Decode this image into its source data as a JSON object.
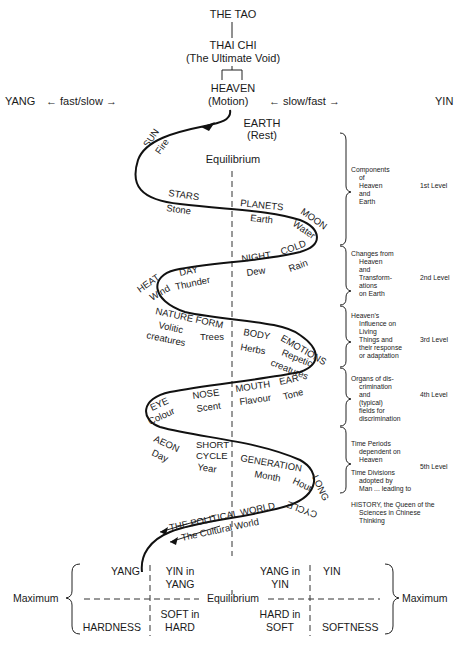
{
  "hierarchy": {
    "tao": "THE TAO",
    "thai_chi": "THAI CHI",
    "thai_chi_sub": "(The Ultimate Void)",
    "heaven": "HEAVEN",
    "motion_line": {
      "yang": "YANG",
      "left_rate": "← fast/slow →",
      "motion": "(Motion)",
      "right_rate": "← slow/fast →",
      "yin": "YIN"
    },
    "earth": "EARTH",
    "earth_sub": "(Rest)",
    "equilibrium": "Equilibrium"
  },
  "spiral_labels": {
    "sun": "SUN",
    "fire": "Fire",
    "stars": "STARS",
    "stone": "Stone",
    "planets": "PLANETS",
    "earth": "Earth",
    "moon": "MOON",
    "water": "Water",
    "night": "NIGHT",
    "dew": "Dew",
    "cold": "COLD",
    "rain": "Rain",
    "heat": "HEAT",
    "day": "DAY",
    "wind": "Wind",
    "thunder": "Thunder",
    "nature_form": "NATURE FORM",
    "volitic": "Volitic",
    "creatures1": "creatures",
    "trees": "Trees",
    "body": "BODY",
    "herbs": "Herbs",
    "emotions": "EMOTIONS",
    "repetic": "Repetic",
    "creatures2": "creatures",
    "eye": "EYE",
    "colour": "Colour",
    "nose": "NOSE",
    "scent": "Scent",
    "mouth": "MOUTH",
    "flavour": "Flavour",
    "ear": "EAR",
    "tone": "Tone",
    "aeon": "AEON",
    "day2": "Day",
    "short": "SHORT",
    "cycle": "CYCLE",
    "year": "Year",
    "generation": "GENERATION",
    "month": "Month",
    "hour": "Hour",
    "long": "LONG",
    "cycle2": "CYCLE",
    "political": "THE POLITICAL WORLD",
    "cultural": "The Cultural World"
  },
  "levels": [
    {
      "desc": [
        "Components",
        "of",
        "Heaven",
        "and",
        "Earth"
      ],
      "label": "1st Level"
    },
    {
      "desc": [
        "Changes from",
        "Heaven",
        "and",
        "Transform-",
        "ations",
        "on Earth"
      ],
      "label": "2nd Level"
    },
    {
      "desc": [
        "Heaven's",
        "Influence on",
        "Living",
        "Things and",
        "their response",
        "or adaptation"
      ],
      "label": "3rd Level"
    },
    {
      "desc": [
        "Organs of dis-",
        "crimination",
        "and",
        "(typical)",
        "fields for",
        "discrimination"
      ],
      "label": "4th Level"
    },
    {
      "desc": [
        "Time Periods",
        "dependent on",
        "Heaven",
        "Time Divisions",
        "adopted by",
        "Man ... leading to"
      ],
      "label": "5th Level"
    }
  ],
  "history": [
    "HISTORY, the Queen of the",
    "Sciences in Chinese",
    "Thinking"
  ],
  "grid": {
    "left_max": "Maximum",
    "right_max": "Maximum",
    "equilibrium": "Equilibrium",
    "top": [
      "YANG",
      "YIN in",
      "YANG",
      "YANG in",
      "YIN",
      "YIN"
    ],
    "bottom": [
      "HARDNESS",
      "SOFT in",
      "HARD",
      "HARD in",
      "SOFT",
      "SOFTNESS"
    ]
  }
}
